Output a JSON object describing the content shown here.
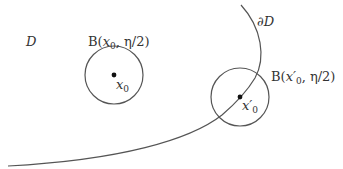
{
  "diagram": {
    "stroke_color": "#555555",
    "dot_color": "#111111",
    "labels": {
      "domain": "D",
      "boundary": "∂D",
      "ball_interior": {
        "prefix": "B(",
        "var": "x",
        "sub": "0",
        "suffix": ", η/2)"
      },
      "ball_boundary": {
        "prefix": "B(",
        "var": "x′",
        "sub": "0",
        "suffix": ", η/2)"
      },
      "point_interior": {
        "var": "x",
        "sub": "0"
      },
      "point_boundary": {
        "var": "x′",
        "sub": "0"
      }
    },
    "circles": [
      {
        "name": "ball-interior",
        "cx": 114,
        "cy": 75,
        "r": 29
      },
      {
        "name": "ball-boundary",
        "cx": 240,
        "cy": 97,
        "r": 29
      }
    ],
    "points": [
      {
        "name": "point-x0",
        "x": 114,
        "y": 75
      },
      {
        "name": "point-x0-prime",
        "x": 240,
        "y": 97
      }
    ],
    "boundary_curve": "M 241 5 C 262 28, 266 58, 255 78 C 246 93, 236 103, 222 115 C 190 140, 120 160, 8 166"
  }
}
